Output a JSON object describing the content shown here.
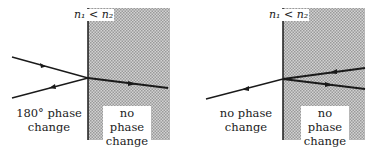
{
  "panels": [
    {
      "index_label": "n₁ < n₂",
      "left_caption": [
        "180° phase",
        "change"
      ],
      "right_caption": [
        "no phase",
        "change"
      ],
      "description": "Light ray in medium n1 hits boundary with n2 > n1; reflected ray has 180° phase change, transmitted ray has no phase change."
    },
    {
      "index_label": "n₁ < n₂",
      "left_caption": [
        "no phase",
        "change"
      ],
      "right_caption": [
        "no phase",
        "change"
      ],
      "description": "Light ray in medium n2 hits boundary with n1 < n2; transmitted ray into n1 has no phase change, reflected ray within n2 has no phase change."
    }
  ],
  "colors": {
    "medium_fill": "#bdbdbd",
    "line": "#1a1a1a"
  }
}
